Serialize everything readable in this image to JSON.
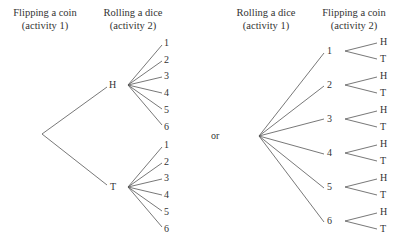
{
  "left_tree": {
    "header_level1": {
      "title": "Flipping a coin",
      "subtitle": "(activity 1)"
    },
    "header_level2": {
      "title": "Rolling a dice",
      "subtitle": "(activity 2)"
    },
    "branches": [
      {
        "label": "H",
        "outcomes": [
          "1",
          "2",
          "3",
          "4",
          "5",
          "6"
        ]
      },
      {
        "label": "T",
        "outcomes": [
          "1",
          "2",
          "3",
          "4",
          "5",
          "6"
        ]
      }
    ]
  },
  "separator": "or",
  "right_tree": {
    "header_level1": {
      "title": "Rolling a dice",
      "subtitle": "(activity 1)"
    },
    "header_level2": {
      "title": "Flipping a coin",
      "subtitle": "(activity 2)"
    },
    "branches": [
      {
        "label": "1",
        "outcomes": [
          "H",
          "T"
        ]
      },
      {
        "label": "2",
        "outcomes": [
          "H",
          "T"
        ]
      },
      {
        "label": "3",
        "outcomes": [
          "H",
          "T"
        ]
      },
      {
        "label": "4",
        "outcomes": [
          "H",
          "T"
        ]
      },
      {
        "label": "5",
        "outcomes": [
          "H",
          "T"
        ]
      },
      {
        "label": "6",
        "outcomes": [
          "H",
          "T"
        ]
      }
    ]
  },
  "colors": {
    "line": "#555555",
    "text": "#333333",
    "background": "#ffffff"
  }
}
